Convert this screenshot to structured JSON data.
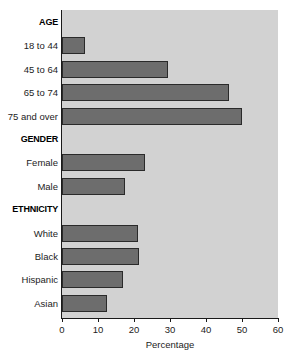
{
  "chart_data": {
    "type": "bar",
    "orientation": "horizontal",
    "title": "",
    "xlabel": "Percentage",
    "ylabel": "",
    "xlim": [
      0,
      60
    ],
    "xticks": [
      0,
      10,
      20,
      30,
      40,
      50,
      60
    ],
    "grid": false,
    "legend": null,
    "bar_color": "#6d6d6d",
    "plot_background": "#d2d2d2",
    "groups": [
      {
        "header": "AGE",
        "categories": [
          "18 to 44",
          "45 to 64",
          "65 to 74",
          "75 and over"
        ],
        "values": [
          6.5,
          29.5,
          46.5,
          50
        ]
      },
      {
        "header": "GENDER",
        "categories": [
          "Female",
          "Male"
        ],
        "values": [
          23,
          17.5
        ]
      },
      {
        "header": "ETHNICITY",
        "categories": [
          "White",
          "Black",
          "Hispanic",
          "Asian"
        ],
        "values": [
          21,
          21.5,
          17,
          12.5
        ]
      }
    ],
    "categories": [
      "18 to 44",
      "45 to 64",
      "65 to 74",
      "75 and over",
      "Female",
      "Male",
      "White",
      "Black",
      "Hispanic",
      "Asian"
    ],
    "values": [
      6.5,
      29.5,
      46.5,
      50,
      23,
      17.5,
      21,
      21.5,
      17,
      12.5
    ]
  },
  "rows": [
    {
      "kind": "header",
      "label": "AGE",
      "value": null
    },
    {
      "kind": "bar",
      "label": "18 to 44",
      "value": 6.5
    },
    {
      "kind": "bar",
      "label": "45 to 64",
      "value": 29.5
    },
    {
      "kind": "bar",
      "label": "65 to 74",
      "value": 46.5
    },
    {
      "kind": "bar",
      "label": "75 and over",
      "value": 50
    },
    {
      "kind": "header",
      "label": "GENDER",
      "value": null
    },
    {
      "kind": "bar",
      "label": "Female",
      "value": 23
    },
    {
      "kind": "bar",
      "label": "Male",
      "value": 17.5
    },
    {
      "kind": "header",
      "label": "ETHNICITY",
      "value": null
    },
    {
      "kind": "bar",
      "label": "White",
      "value": 21
    },
    {
      "kind": "bar",
      "label": "Black",
      "value": 21.5
    },
    {
      "kind": "bar",
      "label": "Hispanic",
      "value": 17
    },
    {
      "kind": "bar",
      "label": "Asian",
      "value": 12.5
    }
  ],
  "axis": {
    "x_title": "Percentage",
    "x_tick_labels": [
      "0",
      "10",
      "20",
      "30",
      "40",
      "50",
      "60"
    ]
  }
}
